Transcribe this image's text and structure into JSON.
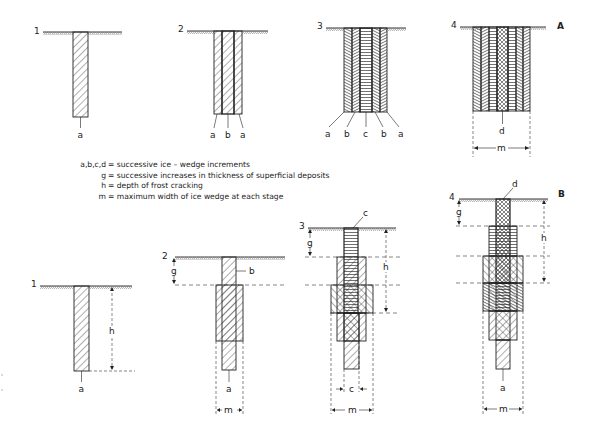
{
  "figure": {
    "series_A": {
      "label": "A",
      "stages": [
        {
          "number": "1",
          "labels": [
            "a"
          ]
        },
        {
          "number": "2",
          "labels": [
            "a",
            "b",
            "a"
          ]
        },
        {
          "number": "3",
          "labels": [
            "a",
            "b",
            "c",
            "b",
            "a"
          ]
        },
        {
          "number": "4",
          "labels": [
            "d"
          ],
          "dimension": "m"
        }
      ]
    },
    "series_B": {
      "label": "B",
      "stages": [
        {
          "number": "1",
          "labels": [
            "a"
          ],
          "dimension": "h"
        },
        {
          "number": "2",
          "labels": [
            "b",
            "a"
          ],
          "dimensions": [
            "g",
            "m"
          ]
        },
        {
          "number": "3",
          "labels": [
            "c"
          ],
          "dimensions": [
            "g",
            "h",
            "c",
            "m"
          ]
        },
        {
          "number": "4",
          "labels": [
            "d",
            "a"
          ],
          "dimensions": [
            "g",
            "h",
            "m"
          ]
        }
      ]
    },
    "legend": [
      {
        "key": "a,b,c,d",
        "text": "= successive ice – wedge increments"
      },
      {
        "key": "g",
        "text": "= successive increases in thickness of superficial deposits"
      },
      {
        "key": "h",
        "text": "= depth of frost cracking"
      },
      {
        "key": "m",
        "text": "= maximum width of ice wedge at each stage"
      }
    ]
  }
}
